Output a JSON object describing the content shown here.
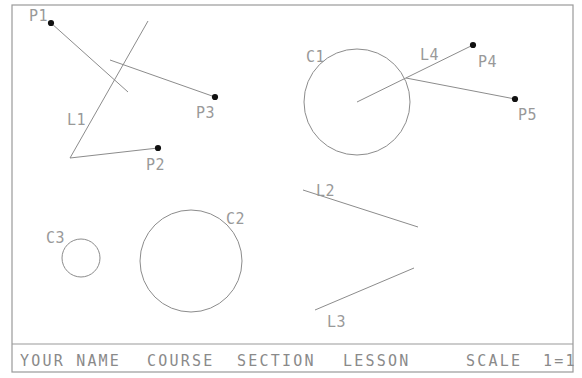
{
  "document": {
    "type": "cad-drawing",
    "background_color": "#ffffff",
    "line_color": "#8c8c8c",
    "label_color": "#999999",
    "point_color": "#111111"
  },
  "frame": {
    "name": "drawing-border",
    "x": 12,
    "y": 5,
    "width": 561,
    "height": 367,
    "titleblock_divider_y": 344
  },
  "titleblock": {
    "fields": [
      {
        "id": "name-field",
        "text": "YOUR NAME",
        "x": 20,
        "y": 366
      },
      {
        "id": "course-field",
        "text": "COURSE",
        "x": 147,
        "y": 366
      },
      {
        "id": "section-field",
        "text": "SECTION",
        "x": 237,
        "y": 366
      },
      {
        "id": "lesson-field",
        "text": "LESSON",
        "x": 343,
        "y": 366
      },
      {
        "id": "scale-field",
        "text": "SCALE",
        "x": 466,
        "y": 366
      },
      {
        "id": "scale-value",
        "text": "1=1",
        "x": 543,
        "y": 366
      }
    ]
  },
  "geometry": {
    "points": [
      {
        "id": "P1",
        "label": "P1",
        "x": 51,
        "y": 23,
        "label_x": 29,
        "label_y": 21
      },
      {
        "id": "P2",
        "label": "P2",
        "x": 158,
        "y": 148,
        "label_x": 146,
        "label_y": 170
      },
      {
        "id": "P3",
        "label": "P3",
        "x": 215,
        "y": 97,
        "label_x": 196,
        "label_y": 118
      },
      {
        "id": "P4",
        "label": "P4",
        "x": 473,
        "y": 45,
        "label_x": 478,
        "label_y": 67
      },
      {
        "id": "P5",
        "label": "P5",
        "x": 515,
        "y": 99,
        "label_x": 518,
        "label_y": 120
      }
    ],
    "lines": [
      {
        "id": "LP1",
        "label": "",
        "x1": 51,
        "y1": 23,
        "x2": 128,
        "y2": 92,
        "label_x": 0,
        "label_y": 0
      },
      {
        "id": "L1",
        "label": "L1",
        "x1": 70,
        "y1": 158,
        "x2": 148,
        "y2": 21,
        "label_x": 67,
        "label_y": 125
      },
      {
        "id": "LP3",
        "label": "",
        "x1": 110,
        "y1": 60,
        "x2": 215,
        "y2": 97,
        "label_x": 0,
        "label_y": 0
      },
      {
        "id": "LP2",
        "label": "",
        "x1": 70,
        "y1": 158,
        "x2": 158,
        "y2": 148,
        "label_x": 0,
        "label_y": 0
      },
      {
        "id": "L4",
        "label": "L4",
        "x1": 357,
        "y1": 102,
        "x2": 473,
        "y2": 45,
        "label_x": 420,
        "label_y": 60
      },
      {
        "id": "LP5",
        "label": "",
        "x1": 406,
        "y1": 78,
        "x2": 515,
        "y2": 99,
        "label_x": 0,
        "label_y": 0
      },
      {
        "id": "L2",
        "label": "L2",
        "x1": 303,
        "y1": 190,
        "x2": 418,
        "y2": 227,
        "label_x": 316,
        "label_y": 196
      },
      {
        "id": "L3",
        "label": "L3",
        "x1": 315,
        "y1": 310,
        "x2": 414,
        "y2": 268,
        "label_x": 327,
        "label_y": 327
      }
    ],
    "circles": [
      {
        "id": "C1",
        "label": "C1",
        "cx": 357,
        "cy": 102,
        "r": 53,
        "label_x": 306,
        "label_y": 62
      },
      {
        "id": "C2",
        "label": "C2",
        "cx": 191,
        "cy": 261,
        "r": 51,
        "label_x": 226,
        "label_y": 224
      },
      {
        "id": "C3",
        "label": "C3",
        "cx": 81,
        "cy": 258,
        "r": 19,
        "label_x": 46,
        "label_y": 243
      }
    ]
  }
}
